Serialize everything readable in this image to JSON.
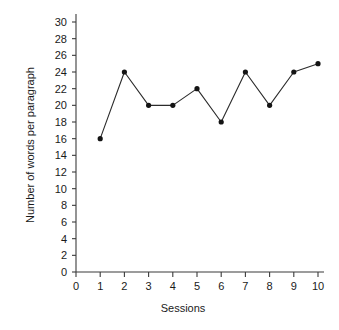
{
  "chart_data": {
    "type": "line",
    "title": "",
    "subtitle": "",
    "xlabel": "Sessions",
    "ylabel": "Number of words per paragraph",
    "x": [
      1,
      2,
      3,
      4,
      5,
      6,
      7,
      8,
      9,
      10
    ],
    "categories": [
      "1",
      "2",
      "3",
      "4",
      "5",
      "6",
      "7",
      "8",
      "9",
      "10"
    ],
    "values": [
      16,
      24,
      20,
      20,
      22,
      18,
      24,
      20,
      24,
      25
    ],
    "series": [
      {
        "name": "Number of words per paragraph",
        "values": [
          16,
          24,
          20,
          20,
          22,
          18,
          24,
          20,
          24,
          25
        ]
      }
    ],
    "xlim": [
      0,
      10
    ],
    "ylim": [
      0,
      30
    ],
    "xticks": [
      0,
      1,
      2,
      3,
      4,
      5,
      6,
      7,
      8,
      9,
      10
    ],
    "xtick_labels": [
      "0",
      "1",
      "2",
      "3",
      "4",
      "5",
      "6",
      "7",
      "8",
      "9",
      "10"
    ],
    "yticks": [
      0,
      2,
      4,
      6,
      8,
      10,
      12,
      14,
      16,
      18,
      20,
      22,
      24,
      26,
      28,
      30
    ],
    "ytick_labels": [
      "0",
      "2",
      "4",
      "6",
      "8",
      "10",
      "12",
      "14",
      "16",
      "18",
      "20",
      "22",
      "24",
      "26",
      "28",
      "30"
    ],
    "grid": false,
    "legend": false,
    "legend_position": "none",
    "marker": "filled-circle",
    "line_color": "#2b2b2b",
    "marker_color": "#141414",
    "background_color": "#ffffff"
  }
}
